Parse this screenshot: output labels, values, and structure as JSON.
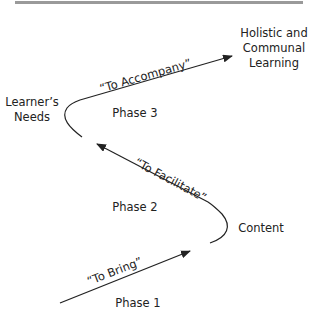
{
  "diagram": {
    "nodes": {
      "top_right": [
        "Holistic and",
        "Communal",
        "Learning"
      ],
      "left": [
        "Learner’s",
        "Needs"
      ],
      "right": "Content"
    },
    "edges": {
      "bring": "“To Bring”",
      "facilitate": "“To Facilitate”",
      "accompany": "“To Accompany”"
    },
    "phases": {
      "phase1": "Phase 1",
      "phase2": "Phase 2",
      "phase3": "Phase 3"
    },
    "colors": {
      "line": "#222222",
      "rule": "#9a9a9a"
    }
  }
}
